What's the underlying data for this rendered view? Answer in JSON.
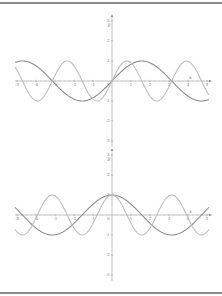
{
  "chart_data": [
    {
      "type": "line",
      "title": "",
      "xlabel": "x",
      "ylabel": "y",
      "xlim": [
        -5.1,
        5.1
      ],
      "ylim": [
        -3.3,
        3.3
      ],
      "x_ticks": [
        -5,
        -4,
        -3,
        -2,
        -1,
        1,
        2,
        3,
        4,
        5
      ],
      "y_ticks": [
        -3,
        -2,
        -1,
        1,
        2,
        3
      ],
      "grid": false,
      "series": [
        {
          "name": "sin(x)",
          "function": "sin(x)",
          "color": "#8c8c8c",
          "x": [
            -5,
            -4,
            -3,
            -2,
            -1,
            0,
            1,
            2,
            3,
            4,
            5
          ],
          "values": [
            0.96,
            0.76,
            -0.14,
            -0.91,
            -0.84,
            0,
            0.84,
            0.91,
            0.14,
            -0.76,
            -0.96
          ]
        },
        {
          "name": "sin(2x)",
          "function": "sin(2x)",
          "color": "#bdbdbd",
          "x": [
            -5,
            -4,
            -3,
            -2,
            -1,
            0,
            1,
            2,
            3,
            4,
            5
          ],
          "values": [
            0.54,
            -0.99,
            0.28,
            0.76,
            -0.91,
            0,
            0.91,
            -0.76,
            -0.28,
            0.99,
            -0.54
          ]
        }
      ]
    },
    {
      "type": "line",
      "title": "",
      "xlabel": "x",
      "ylabel": "y",
      "xlim": [
        -5.1,
        5.1
      ],
      "ylim": [
        -3.3,
        3.3
      ],
      "x_ticks": [
        -5,
        -4,
        -3,
        -2,
        -1,
        1,
        2,
        3,
        4,
        5
      ],
      "y_ticks": [
        -3,
        -2,
        -1,
        1,
        2,
        3
      ],
      "grid": false,
      "series": [
        {
          "name": "cos(x)",
          "function": "cos(x)",
          "color": "#8c8c8c",
          "x": [
            -5,
            -4,
            -3,
            -2,
            -1,
            0,
            1,
            2,
            3,
            4,
            5
          ],
          "values": [
            0.28,
            -0.65,
            -0.99,
            -0.42,
            0.54,
            1,
            0.54,
            -0.42,
            -0.99,
            -0.65,
            0.28
          ]
        },
        {
          "name": "cos(2x)",
          "function": "cos(2x)",
          "color": "#bdbdbd",
          "x": [
            -5,
            -4,
            -3,
            -2,
            -1,
            0,
            1,
            2,
            3,
            4,
            5
          ],
          "values": [
            -0.84,
            -0.15,
            0.96,
            -0.65,
            -0.42,
            1,
            -0.42,
            -0.65,
            0.96,
            -0.15,
            -0.84
          ]
        }
      ]
    }
  ],
  "plots": [
    {
      "origin_x": 112,
      "origin_y": 81,
      "unit_px_x": 19,
      "unit_px_y": 20,
      "axis_left": 15,
      "axis_right": 210,
      "axis_top": 16,
      "axis_bottom": 147
    },
    {
      "origin_x": 112,
      "origin_y": 215,
      "unit_px_x": 19,
      "unit_px_y": 20,
      "axis_left": 15,
      "axis_right": 210,
      "axis_top": 150,
      "axis_bottom": 281
    }
  ]
}
